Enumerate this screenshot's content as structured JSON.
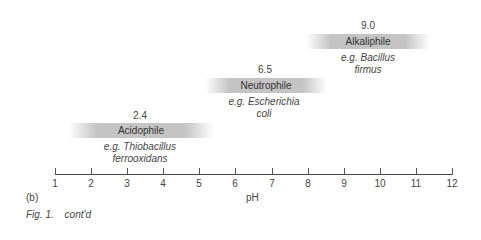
{
  "chart_data": {
    "type": "range-band",
    "xlabel": "pH",
    "xlim": [
      1,
      12
    ],
    "ticks": [
      "1",
      "2",
      "3",
      "4",
      "5",
      "6",
      "7",
      "8",
      "9",
      "10",
      "11",
      "12"
    ],
    "groups": [
      {
        "name": "Acidophile",
        "optimum": "2.4",
        "example_line1": "e.g. Thiobacillus",
        "example_line2": "ferrooxidans"
      },
      {
        "name": "Neutrophile",
        "optimum": "6.5",
        "example_line1": "e.g. Escherichia",
        "example_line2": "coli"
      },
      {
        "name": "Alkaliphile",
        "optimum": "9.0",
        "example_line1": "e.g. Bacillus",
        "example_line2": "firmus"
      }
    ]
  },
  "panel_label": "(b)",
  "caption": {
    "fig": "Fig. 1.",
    "text": "cont'd"
  },
  "colors": {
    "band": "#c8c8c8",
    "axis": "#444444"
  }
}
